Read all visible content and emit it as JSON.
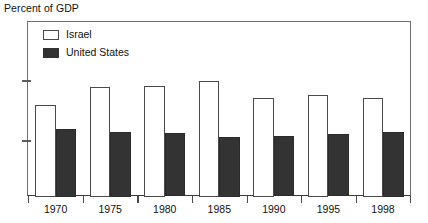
{
  "chart_data": {
    "type": "bar",
    "title": "",
    "ylabel": "Percent of GDP",
    "xlabel": "",
    "categories": [
      "1970",
      "1975",
      "1980",
      "1985",
      "1990",
      "1995",
      "1998"
    ],
    "series": [
      {
        "name": "Israel",
        "color": "#ffffff",
        "values": [
          32,
          38,
          38.5,
          40,
          34.5,
          35.5,
          34.5
        ]
      },
      {
        "name": "United States",
        "color": "#333333",
        "values": [
          24,
          23,
          22.7,
          21.5,
          21.7,
          22.3,
          23
        ]
      }
    ],
    "ylim": [
      0,
      46
    ],
    "yticks": [
      20,
      40
    ],
    "ytick_labels": [
      "20",
      "40"
    ],
    "grid": false,
    "legend_position": "top-left"
  },
  "axis": {
    "y_title": "Percent of GDP"
  },
  "legend": {
    "items": [
      {
        "label": "Israel",
        "swatch": "open-square-swatch"
      },
      {
        "label": "United States",
        "swatch": "filled-square-swatch"
      }
    ]
  }
}
